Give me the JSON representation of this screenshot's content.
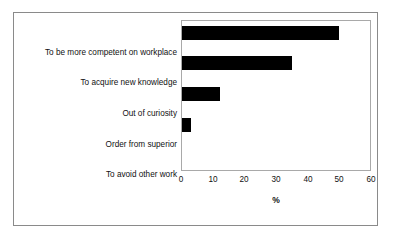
{
  "chart_data": {
    "type": "bar",
    "orientation": "horizontal",
    "title": "",
    "xlabel": "%",
    "ylabel": "",
    "categories": [
      "To be more competent on workplace",
      "To acquire new knowledge",
      "Out of curiosity",
      "Order from superior",
      "To avoid other work"
    ],
    "values": [
      50,
      35,
      12,
      3,
      0
    ],
    "xlim": [
      0,
      60
    ],
    "xticks": [
      "0",
      "10",
      "20",
      "30",
      "40",
      "50",
      "60"
    ],
    "xtick_values": [
      0,
      10,
      20,
      30,
      40,
      50,
      60
    ],
    "grid": false,
    "legend": null,
    "bar_color": "#000000",
    "frame_color": "#8a8a8a",
    "axes_color": "#a9a9a9"
  }
}
